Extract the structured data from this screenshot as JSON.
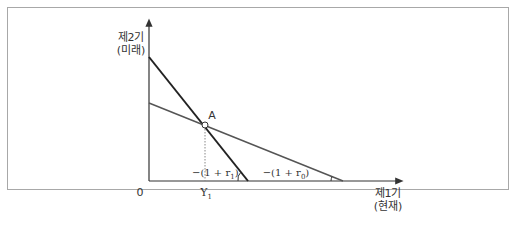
{
  "diagram": {
    "y_axis": {
      "label_line1": "제2기",
      "label_line2": "(미래)"
    },
    "x_axis": {
      "label_line1": "제1기",
      "label_line2": "(현재)"
    },
    "origin_label": "0",
    "point": {
      "label": "A",
      "x_label": "Y",
      "x_label_sub": "1"
    },
    "slope_labels": {
      "steep": {
        "prefix": "−(1 + r",
        "sub": "1",
        "suffix": ")"
      },
      "flat": {
        "prefix": "−(1 + r",
        "sub": "0",
        "suffix": ")"
      }
    },
    "colors": {
      "axis": "#333333",
      "steep_line": "#222222",
      "flat_line": "#555555",
      "frame": "#a8a8a8"
    }
  }
}
